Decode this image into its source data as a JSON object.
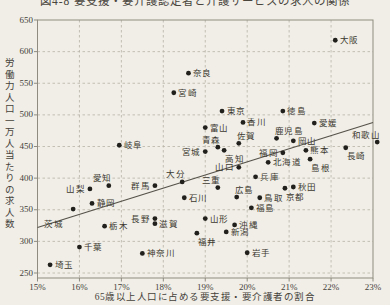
{
  "title": "図4-8 要支援・要介護認定者と介護サービスの求人の関係",
  "x_axis": {
    "label": "65歳以上人口に占める要支援・要介護者の割合",
    "ticks": [
      "15%",
      "16%",
      "17%",
      "18%",
      "19%",
      "20%",
      "21%",
      "22%",
      "23%"
    ],
    "min": 15,
    "max": 23
  },
  "y_axis": {
    "label": "労働力人口一万人当たりの求人数",
    "ticks": [
      "650",
      "600",
      "550",
      "500",
      "450",
      "400",
      "350",
      "300",
      "250"
    ],
    "min": 250,
    "max": 650
  },
  "colors": {
    "background": "#f0eee7",
    "ink": "#3f3c35",
    "grid": "#b7b3a7",
    "frame": "#8f8b80",
    "dot": "#22201c",
    "trend": "#55524a"
  },
  "chart_data": {
    "type": "scatter",
    "title": "図4-8 要支援・要介護認定者と介護サービスの求人の関係",
    "xlabel": "65歳以上人口に占める要支援・要介護者の割合",
    "ylabel": "労働力人口一万人当たりの求人数",
    "xlim": [
      15,
      23
    ],
    "ylim": [
      250,
      650
    ],
    "grid": true,
    "trend_line": {
      "x1": 15,
      "y1": 322,
      "x2": 23,
      "y2": 488
    },
    "points": [
      {
        "name": "北海道",
        "x": 20.5,
        "y": 425,
        "label_pos": "right"
      },
      {
        "name": "青森",
        "x": 19.3,
        "y": 449,
        "label_pos": "above-left"
      },
      {
        "name": "岩手",
        "x": 20.0,
        "y": 282,
        "label_pos": "right"
      },
      {
        "name": "宮城",
        "x": 19.0,
        "y": 442,
        "label_pos": "left"
      },
      {
        "name": "秋田",
        "x": 21.1,
        "y": 386,
        "label_pos": "right"
      },
      {
        "name": "山形",
        "x": 19.0,
        "y": 336,
        "label_pos": "right"
      },
      {
        "name": "福島",
        "x": 20.1,
        "y": 353,
        "label_pos": "right"
      },
      {
        "name": "茨城",
        "x": 15.85,
        "y": 351,
        "label_pos": "below-left"
      },
      {
        "name": "栃木",
        "x": 16.6,
        "y": 324,
        "label_pos": "right"
      },
      {
        "name": "群馬",
        "x": 17.8,
        "y": 388,
        "label_pos": "left"
      },
      {
        "name": "埼玉",
        "x": 15.3,
        "y": 263,
        "label_pos": "right"
      },
      {
        "name": "千葉",
        "x": 16.0,
        "y": 291,
        "label_pos": "right"
      },
      {
        "name": "東京",
        "x": 19.4,
        "y": 506,
        "label_pos": "right"
      },
      {
        "name": "神奈川",
        "x": 17.5,
        "y": 281,
        "label_pos": "right"
      },
      {
        "name": "新潟",
        "x": 19.5,
        "y": 315,
        "label_pos": "right"
      },
      {
        "name": "富山",
        "x": 19.0,
        "y": 480,
        "label_pos": "right"
      },
      {
        "name": "石川",
        "x": 18.5,
        "y": 369,
        "label_pos": "right"
      },
      {
        "name": "福井",
        "x": 18.8,
        "y": 313,
        "label_pos": "below-right"
      },
      {
        "name": "山梨",
        "x": 16.25,
        "y": 383,
        "label_pos": "left"
      },
      {
        "name": "長野",
        "x": 17.8,
        "y": 336,
        "label_pos": "left"
      },
      {
        "name": "岐阜",
        "x": 16.95,
        "y": 452,
        "label_pos": "right"
      },
      {
        "name": "静岡",
        "x": 16.3,
        "y": 360,
        "label_pos": "right"
      },
      {
        "name": "愛知",
        "x": 16.7,
        "y": 388,
        "label_pos": "above-left"
      },
      {
        "name": "三重",
        "x": 19.3,
        "y": 385,
        "label_pos": "above-left"
      },
      {
        "name": "滋賀",
        "x": 17.8,
        "y": 328,
        "label_pos": "right"
      },
      {
        "name": "京都",
        "x": 20.9,
        "y": 384,
        "label_pos": "below-right"
      },
      {
        "name": "大阪",
        "x": 22.1,
        "y": 618,
        "label_pos": "right"
      },
      {
        "name": "兵庫",
        "x": 20.2,
        "y": 402,
        "label_pos": "right"
      },
      {
        "name": "奈良",
        "x": 18.6,
        "y": 566,
        "label_pos": "right"
      },
      {
        "name": "和歌山",
        "x": 23.1,
        "y": 457,
        "label_pos": "above-left"
      },
      {
        "name": "鳥取",
        "x": 20.3,
        "y": 369,
        "label_pos": "right"
      },
      {
        "name": "島根",
        "x": 21.5,
        "y": 430,
        "label_pos": "below-right"
      },
      {
        "name": "岡山",
        "x": 21.1,
        "y": 459,
        "label_pos": "right"
      },
      {
        "name": "広島",
        "x": 19.75,
        "y": 370,
        "label_pos": "above-right"
      },
      {
        "name": "山口",
        "x": 19.8,
        "y": 417,
        "label_pos": "left"
      },
      {
        "name": "徳島",
        "x": 20.85,
        "y": 506,
        "label_pos": "right"
      },
      {
        "name": "香川",
        "x": 19.9,
        "y": 488,
        "label_pos": "right"
      },
      {
        "name": "愛媛",
        "x": 21.6,
        "y": 487,
        "label_pos": "right"
      },
      {
        "name": "高知",
        "x": 19.45,
        "y": 444,
        "label_pos": "below-right"
      },
      {
        "name": "福岡",
        "x": 20.85,
        "y": 440,
        "label_pos": "left"
      },
      {
        "name": "佐賀",
        "x": 19.8,
        "y": 455,
        "label_pos": "above-right"
      },
      {
        "name": "長崎",
        "x": 22.35,
        "y": 448,
        "label_pos": "below-right"
      },
      {
        "name": "熊本",
        "x": 21.4,
        "y": 444,
        "label_pos": "right"
      },
      {
        "name": "大分",
        "x": 18.45,
        "y": 394,
        "label_pos": "above-left"
      },
      {
        "name": "宮崎",
        "x": 18.25,
        "y": 535,
        "label_pos": "right"
      },
      {
        "name": "鹿児島",
        "x": 20.7,
        "y": 463,
        "label_pos": "above-right"
      },
      {
        "name": "沖縄",
        "x": 19.7,
        "y": 326,
        "label_pos": "right"
      }
    ]
  }
}
